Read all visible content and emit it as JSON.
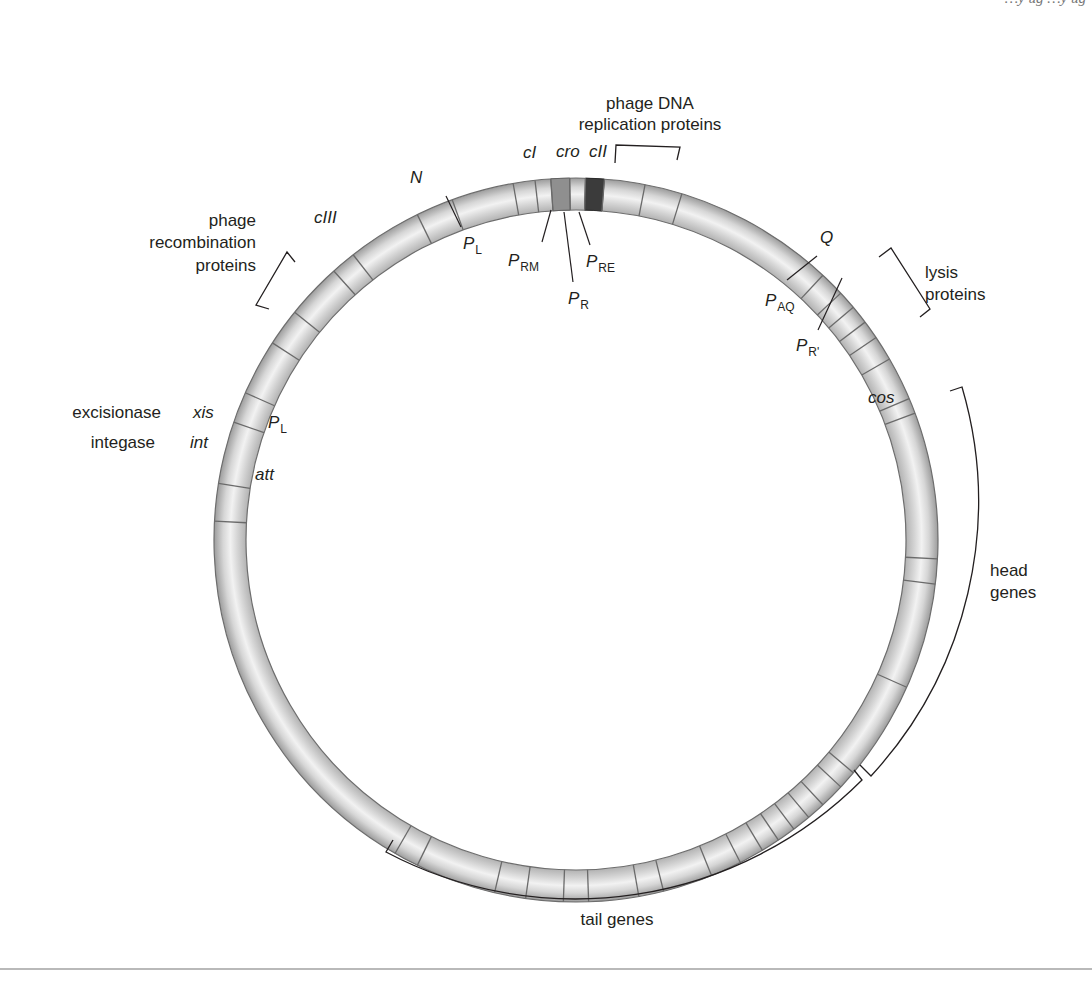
{
  "header": {
    "running_head_fragment": "…y ug …y ug"
  },
  "diagram": {
    "ring": {
      "cx": 576,
      "cy": 540,
      "r_outer": 362,
      "r_inner": 330,
      "fill_light": "#f0f0f0",
      "fill_mid": "#cfcfcf",
      "stroke": "#6d6d6d",
      "cro_fill": "#8a8a8a",
      "cII_fill": "#3a3a3a"
    },
    "gene_labels": {
      "cI": "cI",
      "cro": "cro",
      "cII": "cII",
      "N": "N",
      "cIII": "cIII",
      "Q": "Q",
      "xis": "xis",
      "int": "int",
      "att": "att",
      "cos": "cos"
    },
    "promoters": {
      "PL_top": {
        "main": "P",
        "sub": "L"
      },
      "PRM": {
        "main": "P",
        "sub": "RM"
      },
      "PR": {
        "main": "P",
        "sub": "R"
      },
      "PRE": {
        "main": "P",
        "sub": "RE"
      },
      "PAQ": {
        "main": "P",
        "sub": "AQ"
      },
      "PRprime": {
        "main": "P",
        "sub": "R'"
      },
      "PL_left": {
        "main": "P",
        "sub": "L"
      }
    },
    "region_labels": {
      "replication": [
        "phage DNA",
        "replication proteins"
      ],
      "recombination": [
        "phage",
        "recombination",
        "proteins"
      ],
      "lysis": [
        "lysis",
        "proteins"
      ],
      "head": [
        "head",
        "genes"
      ],
      "tail": [
        "tail genes"
      ],
      "excisionase": "excisionase",
      "integase": "integase"
    },
    "boundaries_deg": [
      -87,
      -81,
      -71,
      -66,
      -57,
      -51,
      -42,
      -38,
      -26,
      -20,
      -10,
      -6.5,
      -4,
      -1,
      1.5,
      4.5,
      11,
      17,
      43,
      47,
      50,
      53,
      56,
      60,
      67,
      69.5,
      93,
      97,
      114,
      130,
      133,
      137,
      140,
      143,
      146,
      149,
      153,
      158,
      166,
      170,
      178,
      182,
      188,
      193,
      206,
      210
    ]
  }
}
